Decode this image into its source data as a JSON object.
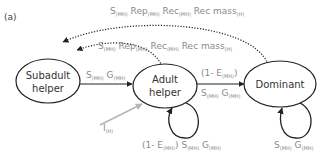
{
  "panel_label": "(a)",
  "nodes": [
    {
      "id": "subadult",
      "line1": "Subadult",
      "line2": "helper"
    },
    {
      "id": "adult",
      "line1": "Adult",
      "line2": "helper"
    },
    {
      "id": "dominant",
      "line1": "Dominant"
    }
  ],
  "edges": {
    "dominant_to_subadult": {
      "style": "dotted",
      "terms": [
        {
          "main": "S",
          "sub": "(MH)"
        },
        {
          "main": "Rep",
          "sub": "(MH)"
        },
        {
          "main": "Rec",
          "sub": "(MH)"
        },
        {
          "main": "Rec mass",
          "sub": "(H)"
        }
      ]
    },
    "adult_to_subadult": {
      "style": "dotted",
      "terms": [
        {
          "main": "S",
          "sub": "(MH)"
        },
        {
          "main": "Rep",
          "sub": "(MH)"
        },
        {
          "main": "Rec",
          "sub": "(MH)"
        },
        {
          "main": "Rec mass",
          "sub": "(H)"
        }
      ]
    },
    "subadult_to_adult": {
      "style": "solid",
      "terms": [
        {
          "main": "S",
          "sub": "(MH)"
        },
        {
          "main": "G",
          "sub": "(MH)"
        }
      ]
    },
    "adult_to_dominant": {
      "style": "solid",
      "top": {
        "prefix": "(1- E",
        "sub": "(MH)",
        "suffix": ")"
      },
      "terms": [
        {
          "main": "S",
          "sub": "(MH)"
        },
        {
          "main": "G",
          "sub": "(MH)"
        }
      ]
    },
    "immigration_to_adult": {
      "style": "solid-gray",
      "terms": [
        {
          "main": "I",
          "sub": "(H)"
        }
      ]
    },
    "adult_self_loop": {
      "style": "solid",
      "prefix": "(1- E",
      "prefix_sub": "(MH)",
      "prefix_suffix": ")",
      "terms": [
        {
          "main": "S",
          "sub": "(MH)"
        },
        {
          "main": "G",
          "sub": "(MH)"
        }
      ]
    },
    "dominant_self_loop": {
      "style": "solid",
      "terms": [
        {
          "main": "S",
          "sub": "(MH)"
        },
        {
          "main": "G",
          "sub": "(MH)"
        }
      ]
    }
  },
  "colors": {
    "node_stroke": "#222222",
    "edge_stroke": "#222222",
    "label_gray": "#8a8a8a",
    "immigration_stroke": "#b5b5b5"
  }
}
